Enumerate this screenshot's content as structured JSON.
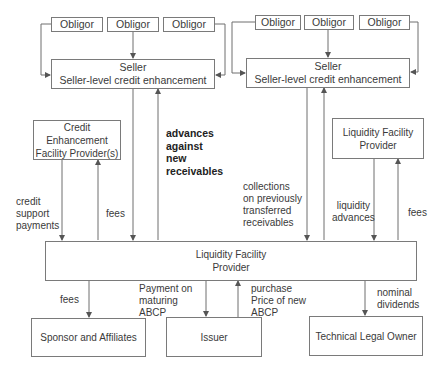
{
  "diagram": {
    "left_cluster": {
      "obligors": [
        "Obligor",
        "Obligor",
        "Obligor"
      ],
      "seller": {
        "line1": "Seller",
        "line2": "Seller-level credit enhancement"
      }
    },
    "right_cluster": {
      "obligors": [
        "Obligor",
        "Obligor",
        "Obligor"
      ],
      "seller": {
        "line1": "Seller",
        "line2": "Seller-level credit enhancement"
      }
    },
    "credit_enhancement_provider": {
      "line1": "Credit Enhancement",
      "line2": "Facility Provider(s)"
    },
    "liquidity_provider_small": {
      "line1": "Liquidity Facility",
      "line2": "Provider"
    },
    "liquidity_provider_main": {
      "line1": "Liquidity Facility",
      "line2": "Provider"
    },
    "bottom_boxes": {
      "sponsor": "Sponsor and Affiliates",
      "issuer": "Issuer",
      "technical_owner": "Technical Legal Owner"
    },
    "flow_labels": {
      "credit_support_payments": "credit\nsupport\npayments",
      "fees_ce": "fees",
      "advances_against_new_receivables": "advances\nagainst\nnew\nreceivables",
      "collections": "collections\non previously\ntransferred\nreceivables",
      "liquidity_advances": "liquidity\nadvances",
      "fees_lf": "fees",
      "fees_sponsor": "fees",
      "payment_on_maturing": "Payment on\nmaturing\nABCP",
      "purchase_price": "purchase\nPrice of new\nABCP",
      "nominal_dividends": "nominal\ndividends"
    },
    "colors": {
      "line": "#6e6e6e",
      "border": "#7a7a7a",
      "text": "#3a3a3a"
    }
  }
}
